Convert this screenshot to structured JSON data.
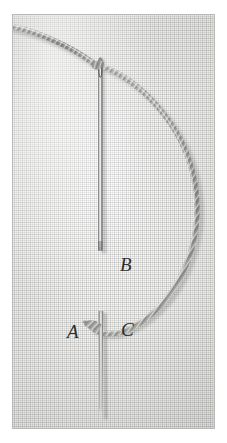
{
  "figure": {
    "kind": "photograph",
    "caption": "",
    "background_color": "#ffffff",
    "plate": {
      "border_color": "#b9b9b7",
      "fabric_color": "#f3f3f1"
    }
  },
  "labels": {
    "b": "B",
    "a": "A",
    "c": "C"
  },
  "objects": {
    "needle": {
      "name": "sewing-needle",
      "color_light": "#e9e9e9",
      "color_dark": "#5d5d5d",
      "eye_label": "needle-eye"
    },
    "thread": {
      "name": "twisted-thread",
      "color": "#9a9a96",
      "highlight": "#d6d6d2"
    },
    "fabric": {
      "name": "woven-fabric",
      "color": "#f3f3f1"
    }
  }
}
